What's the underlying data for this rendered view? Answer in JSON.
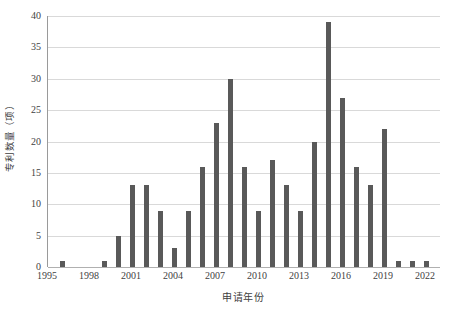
{
  "chart_data": {
    "type": "bar",
    "title": "",
    "xlabel": "申请年份",
    "ylabel": "专利数量（项）",
    "grid": true,
    "legend": false,
    "xlim": [
      1995,
      2023
    ],
    "ylim": [
      0,
      40
    ],
    "ytick_values": [
      0,
      5,
      10,
      15,
      20,
      25,
      30,
      35,
      40
    ],
    "ytick_labels": [
      "0",
      "5",
      "10",
      "15",
      "20",
      "25",
      "30",
      "35",
      "40"
    ],
    "xtick_values": [
      1995,
      1998,
      2001,
      2004,
      2007,
      2010,
      2013,
      2016,
      2019,
      2022
    ],
    "xtick_labels": [
      "1995",
      "1998",
      "2001",
      "2004",
      "2007",
      "2010",
      "2013",
      "2016",
      "2019",
      "2022"
    ],
    "categories": [
      1996,
      1999,
      2000,
      2001,
      2002,
      2003,
      2004,
      2005,
      2006,
      2007,
      2008,
      2009,
      2010,
      2011,
      2012,
      2013,
      2014,
      2015,
      2016,
      2017,
      2018,
      2019,
      2020,
      2021,
      2022
    ],
    "values": [
      1,
      1,
      5,
      13,
      13,
      9,
      3,
      9,
      16,
      23,
      30,
      16,
      9,
      17,
      13,
      9,
      20,
      39,
      27,
      16,
      13,
      22,
      1,
      1,
      1
    ],
    "bar_color": "#595959",
    "grid_color": "#d9d9d9",
    "axis_color": "#9a9a9a"
  }
}
